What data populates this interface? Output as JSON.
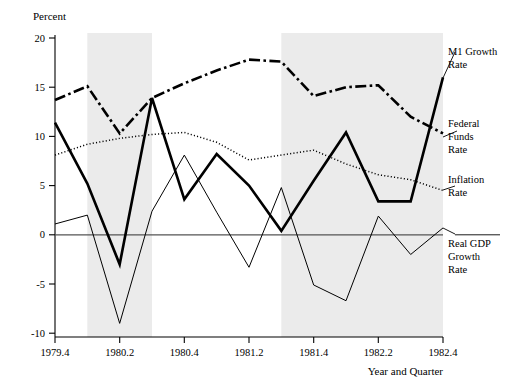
{
  "chart_data": {
    "type": "line",
    "title": "",
    "ylabel": "Percent",
    "xlabel": "Year and Quarter",
    "ylim": [
      -10,
      20
    ],
    "yticks": [
      -10,
      -5,
      0,
      5,
      10,
      15,
      20
    ],
    "ytick_labels": [
      "-10",
      "-5",
      "0",
      "5",
      "10",
      "15",
      "20"
    ],
    "xlim": [
      1979.4,
      1982.4
    ],
    "x": [
      "1979.4",
      "1980.1",
      "1980.2",
      "1980.3",
      "1980.4",
      "1981.1",
      "1981.2",
      "1981.3",
      "1981.4",
      "1982.1",
      "1982.2",
      "1982.3",
      "1982.4"
    ],
    "xtick_labels": [
      "1979.4",
      "1980.2",
      "1980.4",
      "1981.2",
      "1981.4",
      "1982.2",
      "1982.4"
    ],
    "xtick_positions": [
      0,
      2,
      4,
      6,
      8,
      10,
      12
    ],
    "grid": false,
    "legend_position": "right-inline",
    "series": [
      {
        "name": "M1 Growth Rate",
        "style": "dash-dot",
        "values": [
          13.7,
          15.1,
          10.3,
          13.9,
          15.4,
          16.7,
          17.8,
          17.6,
          14.1,
          15.0,
          15.2,
          12.0,
          10.3
        ]
      },
      {
        "name": "Federal Funds Rate",
        "style": "solid-thick",
        "values": [
          11.4,
          5.2,
          -3.0,
          13.9,
          3.6,
          8.2,
          5.0,
          0.4,
          5.5,
          10.4,
          3.4,
          3.4,
          16.0
        ]
      },
      {
        "name": "Inflation Rate",
        "style": "dotted",
        "values": [
          8.1,
          9.2,
          9.8,
          10.2,
          10.4,
          9.4,
          7.6,
          8.1,
          8.6,
          7.2,
          6.1,
          5.6,
          4.5
        ]
      },
      {
        "name": "Real GDP Growth Rate",
        "style": "solid-thin",
        "values": [
          1.1,
          2.0,
          -9.0,
          2.4,
          8.1,
          2.3,
          -3.3,
          4.8,
          -5.1,
          -6.7,
          1.9,
          -2.0,
          0.7
        ]
      }
    ],
    "shaded_bands": [
      {
        "label": "recession-band-1",
        "start_index": 1,
        "end_index": 3
      },
      {
        "label": "recession-band-2",
        "start_index": 7,
        "end_index": 12
      }
    ]
  },
  "legend": {
    "m1": {
      "line1": "M1 Growth",
      "line2": "Rate"
    },
    "ffr": {
      "line1": "Federal",
      "line2": "Funds",
      "line3": "Rate"
    },
    "inflation": {
      "line1": "Inflation",
      "line2": "Rate"
    },
    "gdp": {
      "line1": "Real GDP",
      "line2": "Growth",
      "line3": "Rate"
    }
  },
  "axes": {
    "y_title": "Percent",
    "x_title": "Year and Quarter"
  }
}
